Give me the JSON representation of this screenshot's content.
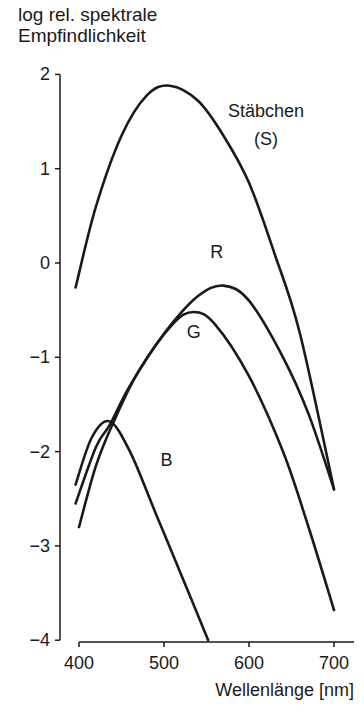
{
  "chart_data": {
    "type": "line",
    "title": "",
    "ylabel": "log rel. spektrale Empfindlichkeit",
    "ylabel_lines": [
      "log rel. spektrale",
      "Empfindlichkeit"
    ],
    "xlabel": "Wellenlänge [nm]",
    "xlim": [
      390,
      725
    ],
    "ylim": [
      -4,
      2
    ],
    "xticks": [
      400,
      500,
      600,
      700
    ],
    "yticks": [
      2,
      1,
      0,
      -1,
      -2,
      -3,
      -4
    ],
    "ytick_labels": [
      "2",
      "1",
      "0",
      "−1",
      "−2",
      "−3",
      "−4"
    ],
    "grid": false,
    "legend": "inline labels",
    "series": [
      {
        "name": "Stäbchen (S)",
        "label_lines": [
          "Stäbchen",
          "(S)"
        ],
        "x": [
          396,
          420,
          450,
          480,
          507,
          540,
          570,
          600,
          630,
          660,
          700
        ],
        "values": [
          -0.26,
          0.6,
          1.35,
          1.78,
          1.88,
          1.72,
          1.35,
          0.85,
          0.1,
          -0.75,
          -2.4
        ]
      },
      {
        "name": "R",
        "x": [
          396,
          420,
          436,
          460,
          500,
          540,
          570,
          600,
          640,
          670,
          700
        ],
        "values": [
          -2.55,
          -1.95,
          -1.72,
          -1.3,
          -0.75,
          -0.35,
          -0.24,
          -0.4,
          -1.0,
          -1.6,
          -2.4
        ]
      },
      {
        "name": "G",
        "x": [
          400,
          420,
          440,
          470,
          510,
          535,
          560,
          600,
          640,
          670,
          700
        ],
        "values": [
          -2.8,
          -2.15,
          -1.7,
          -1.15,
          -0.65,
          -0.52,
          -0.65,
          -1.2,
          -2.0,
          -2.8,
          -3.68
        ]
      },
      {
        "name": "B",
        "x": [
          396,
          415,
          436,
          460,
          490,
          520,
          552
        ],
        "values": [
          -2.35,
          -1.85,
          -1.68,
          -2.0,
          -2.65,
          -3.3,
          -4.0
        ]
      }
    ],
    "annotations": [
      {
        "text": "Stäbchen",
        "x": 620,
        "y": 1.55
      },
      {
        "text": "(S)",
        "x": 620,
        "y": 1.25
      },
      {
        "text": "R",
        "x": 562,
        "y": 0.05
      },
      {
        "text": "G",
        "x": 535,
        "y": -0.8
      },
      {
        "text": "B",
        "x": 503,
        "y": -2.15
      }
    ]
  }
}
